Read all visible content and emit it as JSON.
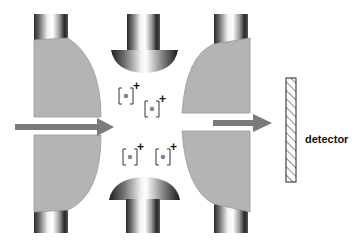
{
  "diagram": {
    "components": {
      "ring_electrode_left": "left ring electrode (cross-section)",
      "ring_electrode_right": "right ring electrode (cross-section)",
      "end_cap_top": "top end-cap electrode",
      "end_cap_bottom": "bottom end-cap electrode",
      "detector": "detector"
    },
    "labels": {
      "detector": "detector"
    },
    "ions": [
      {
        "symbol": "[·]",
        "charge": "+"
      },
      {
        "symbol": "[·]",
        "charge": "+"
      },
      {
        "symbol": "[·]",
        "charge": "+"
      },
      {
        "symbol": "[·]",
        "charge": "+"
      }
    ],
    "arrows": [
      {
        "name": "incoming-beam",
        "direction": "right"
      },
      {
        "name": "outgoing-beam",
        "direction": "right"
      }
    ],
    "colors": {
      "electrode_fill": "#b4b4b4",
      "electrode_edge": "#9a9a9a",
      "arrow": "#7a7a7a",
      "ion_dot": "#888888",
      "ink": "#111111"
    }
  }
}
